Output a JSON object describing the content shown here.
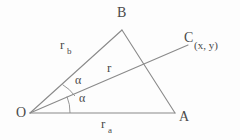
{
  "figure": {
    "type": "geometry-diagram",
    "background_color": "#fdfdfd",
    "stroke_color": "#8a8a8a",
    "text_color": "#4a4a4a"
  },
  "points": {
    "O": {
      "label": "O",
      "x": 30,
      "y": 113
    },
    "A": {
      "label": "A",
      "x": 175,
      "y": 113
    },
    "B": {
      "label": "B",
      "x": 122,
      "y": 30
    },
    "C": {
      "label": "C",
      "x": 188,
      "y": 45
    }
  },
  "annotations": {
    "c_coordinates": "(x, y)",
    "segment_ob": {
      "base": "r",
      "subscript": "b"
    },
    "segment_oa": {
      "base": "r",
      "subscript": "a"
    },
    "segment_oc": {
      "base": "r"
    },
    "angle_upper": "α",
    "angle_lower": "α"
  },
  "segments": [
    {
      "name": "OA",
      "from": "O",
      "to": "A"
    },
    {
      "name": "OB",
      "from": "O",
      "to": "B"
    },
    {
      "name": "AB",
      "from": "A",
      "to": "B"
    },
    {
      "name": "OC",
      "from": "O",
      "to": "C"
    }
  ],
  "angles": [
    {
      "name": "angle-BOC",
      "label": "α",
      "vertex": "O",
      "between": [
        "OB",
        "OC"
      ]
    },
    {
      "name": "angle-COA",
      "label": "α",
      "vertex": "O",
      "between": [
        "OC",
        "OA"
      ]
    }
  ]
}
